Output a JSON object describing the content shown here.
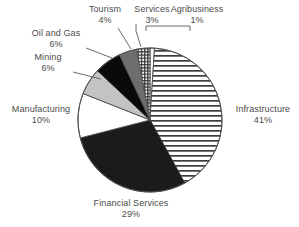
{
  "chart_data": {
    "type": "pie",
    "title": "",
    "xlabel": "",
    "ylabel": "",
    "legend_position": "none",
    "grid": false,
    "start_angle_deg": 0,
    "direction": "clockwise",
    "categories": [
      "Agribusiness",
      "Infrastructure",
      "Financial Services",
      "Manufacturing",
      "Mining",
      "Oil and Gas",
      "Tourism",
      "Services"
    ],
    "values": [
      1,
      41,
      29,
      10,
      6,
      6,
      4,
      3
    ],
    "value_labels": [
      "1%",
      "41%",
      "29%",
      "10%",
      "6%",
      "6%",
      "4%",
      "3%"
    ],
    "unit": "%",
    "slices": [
      {
        "name": "Agribusiness",
        "value": 1,
        "label": "Agribusiness",
        "pct": "1%",
        "fill": "#ffffff",
        "pattern": "solid-white"
      },
      {
        "name": "Infrastructure",
        "value": 41,
        "label": "Infrastructure",
        "pct": "41%",
        "fill": "#ffffff",
        "pattern": "horizontal-lines"
      },
      {
        "name": "Financial Services",
        "value": 29,
        "label": "Financial Services",
        "pct": "29%",
        "fill": "#1b1b1b",
        "pattern": "solid-dark"
      },
      {
        "name": "Manufacturing",
        "value": 10,
        "label": "Manufacturing",
        "pct": "10%",
        "fill": "#ffffff",
        "pattern": "solid-white"
      },
      {
        "name": "Mining",
        "value": 6,
        "label": "Mining",
        "pct": "6%",
        "fill": "#c3c3c3",
        "pattern": "solid-light-gray"
      },
      {
        "name": "Oil and Gas",
        "value": 6,
        "label": "Oil and Gas",
        "pct": "6%",
        "fill": "#0a0a0a",
        "pattern": "solid-black"
      },
      {
        "name": "Tourism",
        "value": 4,
        "label": "Tourism",
        "pct": "4%",
        "fill": "#6e6e6e",
        "pattern": "solid-mid-gray"
      },
      {
        "name": "Services",
        "value": 3,
        "label": "Services",
        "pct": "3%",
        "fill": "#ffffff",
        "pattern": "grid-crosshatch"
      }
    ]
  },
  "labels": {
    "tourism": {
      "name": "Tourism",
      "pct": "4%"
    },
    "services": {
      "name": "Services",
      "pct": "3%"
    },
    "agribusiness": {
      "name": "Agribusiness",
      "pct": "1%"
    },
    "oil_and_gas": {
      "name": "Oil and Gas",
      "pct": "6%"
    },
    "mining": {
      "name": "Mining",
      "pct": "6%"
    },
    "manufacturing": {
      "name": "Manufacturing",
      "pct": "10%"
    },
    "infrastructure": {
      "name": "Infrastructure",
      "pct": "41%"
    },
    "financial": {
      "name": "Financial Services",
      "pct": "29%"
    }
  },
  "colors": {
    "text": "#4b4b4b",
    "outline": "#555555",
    "background": "#ffffff",
    "dark_slice": "#1b1b1b",
    "black_slice": "#0a0a0a",
    "mid_gray_slice": "#6e6e6e",
    "light_gray_slice": "#c3c3c3"
  }
}
